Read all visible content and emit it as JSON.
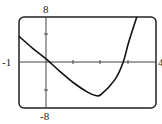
{
  "chart_data": {
    "type": "line",
    "title": "",
    "xlabel": "",
    "ylabel": "",
    "xlim": [
      -1,
      4
    ],
    "ylim": [
      -8,
      8
    ],
    "x_ticks": [
      1,
      2,
      3
    ],
    "y_ticks": [
      -4,
      4
    ],
    "labels": {
      "xmin": "-1",
      "xmax": "4",
      "ymax": "8",
      "ymin": "-8"
    },
    "series": [
      {
        "name": "f(x)",
        "x": [
          -1,
          -0.5,
          0,
          0.5,
          1,
          1.5,
          1.8,
          2.0,
          2.5,
          2.8,
          3.0,
          3.3
        ],
        "y": [
          4.6,
          2.5,
          0.6,
          -1.6,
          -3.6,
          -5.2,
          -5.8,
          -5.6,
          -3.0,
          0.0,
          3.5,
          8
        ]
      }
    ],
    "grid": false,
    "legend": null
  }
}
